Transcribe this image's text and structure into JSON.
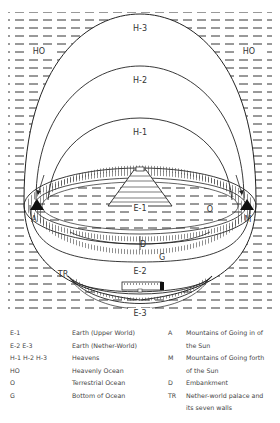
{
  "diagram": {
    "labels": {
      "h3": "H-3",
      "h2": "H-2",
      "h1": "H-1",
      "ho_left": "HO",
      "ho_right": "HO",
      "e1": "E-1",
      "o": "O",
      "a": "A",
      "m": "M",
      "d": "D",
      "g": "G",
      "tr": "TR",
      "e2": "E-2",
      "e3": "E-3"
    },
    "colors": {
      "line": "#222222",
      "background": "#ffffff"
    }
  },
  "legend": {
    "left": [
      {
        "code": "E-1",
        "desc": "Earth (Upper World)"
      },
      {
        "code": "E-2  E-3",
        "desc": "Earth (Nether-World)"
      },
      {
        "code": "H-1 H-2  H-3",
        "desc": "Heavens"
      },
      {
        "code": "HO",
        "desc": "Heavenly Ocean"
      },
      {
        "code": "O",
        "desc": "Terrestrial Ocean"
      },
      {
        "code": "G",
        "desc": "Bottom of Ocean"
      }
    ],
    "right": [
      {
        "code": "A",
        "desc": "Mountains of Going in of",
        "desc2": "the Sun"
      },
      {
        "code": "M",
        "desc": "Mountains of Going forth",
        "desc2": "of the Sun"
      },
      {
        "code": "D",
        "desc": "Embankment"
      },
      {
        "code": "TR",
        "desc": "Nether-world palace and",
        "desc2": "its seven walls"
      }
    ]
  }
}
